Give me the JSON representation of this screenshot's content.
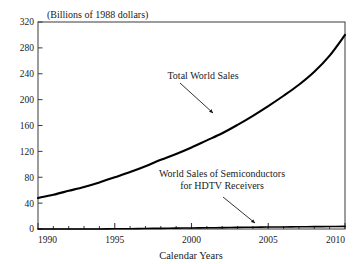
{
  "chart_data": {
    "type": "line",
    "title": "",
    "subtitle": "",
    "unit_label": "(Billions of 1988 dollars)",
    "xlabel": "Calendar Years",
    "ylabel": "",
    "xlim": [
      1990,
      2010
    ],
    "ylim": [
      0,
      320
    ],
    "grid": false,
    "legend_position": "none",
    "x_ticks_major": [
      "1990",
      "1995",
      "2000",
      "2005",
      "2010"
    ],
    "x_ticks_major_values": [
      1990,
      1995,
      2000,
      2005,
      2010
    ],
    "x_ticks_minor_values": [
      1991,
      1992,
      1993,
      1994,
      1996,
      1997,
      1998,
      1999,
      2001,
      2002,
      2003,
      2004,
      2006,
      2007,
      2008,
      2009
    ],
    "y_ticks": [
      "0",
      "40",
      "80",
      "120",
      "160",
      "200",
      "240",
      "280",
      "320"
    ],
    "y_tick_values": [
      0,
      40,
      80,
      120,
      160,
      200,
      240,
      280,
      320
    ],
    "x": [
      1990,
      1991,
      1992,
      1993,
      1994,
      1995,
      1996,
      1997,
      1998,
      1999,
      2000,
      2001,
      2002,
      2003,
      2004,
      2005,
      2006,
      2007,
      2008,
      2009,
      2010
    ],
    "series": [
      {
        "name": "Total World Sales",
        "color": "#000000",
        "values": [
          48,
          53,
          59,
          65,
          72,
          80,
          88,
          97,
          107,
          116,
          126,
          137,
          148,
          161,
          175,
          190,
          206,
          223,
          243,
          268,
          300
        ]
      },
      {
        "name": "World Sales of Semiconductors for HDTV Receivers",
        "color": "#000000",
        "values": [
          0,
          0,
          0,
          0,
          0,
          0.3,
          0.5,
          0.8,
          1,
          1.3,
          1.6,
          1.9,
          2.2,
          2.5,
          2.8,
          3,
          3.2,
          3.4,
          3.6,
          3.8,
          4
        ]
      }
    ],
    "annotations": [
      {
        "id": "total-world-sales",
        "lines": [
          "Total World Sales"
        ],
        "text_anchor_x": 203,
        "text_anchor_y": 79,
        "arrow_from_x": 180,
        "arrow_from_y": 83,
        "arrow_to_x": 213,
        "arrow_to_y": 113
      },
      {
        "id": "hdtv-semiconductors",
        "lines": [
          "World Sales of Semiconductors",
          "for HDTV Receivers"
        ],
        "text_anchor_x": 222,
        "text_anchor_y": 177,
        "arrow_from_x": 223,
        "arrow_from_y": 197,
        "arrow_to_x": 255,
        "arrow_to_y": 223
      }
    ],
    "plot_area": {
      "left": 38,
      "right": 345,
      "top": 22,
      "bottom": 229,
      "frame_color": "#3a3a3a",
      "background": "#ffffff"
    }
  }
}
